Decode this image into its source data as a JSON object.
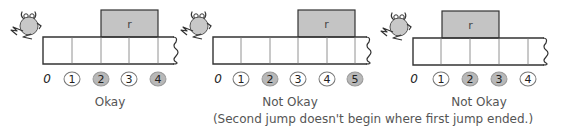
{
  "colors": {
    "box_fill": "#c4c4c4",
    "stroke": "#333333",
    "circle_shaded": "#b8b8b8",
    "frog_fill": "#c8c8c8"
  },
  "panels": [
    {
      "id": "okay",
      "x": 0,
      "strip": {
        "left": 43,
        "cells": [
          43,
          72,
          101,
          129,
          158
        ],
        "right": 170,
        "top": 37,
        "bottom": 64
      },
      "box": {
        "left": 101,
        "right": 158,
        "top": 10,
        "bottom": 37,
        "label": "r"
      },
      "zero_label": "0",
      "zero_x": 47,
      "numbers": [
        {
          "label": "1",
          "x": 72,
          "shaded": false
        },
        {
          "label": "2",
          "x": 101,
          "shaded": true
        },
        {
          "label": "3",
          "x": 129,
          "shaded": false
        },
        {
          "label": "4",
          "x": 158,
          "shaded": true
        }
      ],
      "caption": "Okay",
      "caption_x": 110,
      "note": ""
    },
    {
      "id": "not-okay-1",
      "x": 190,
      "strip": {
        "left": 213,
        "cells": [
          213,
          241,
          270,
          298,
          327,
          355
        ],
        "right": 363,
        "top": 37,
        "bottom": 64
      },
      "box": {
        "left": 298,
        "right": 355,
        "top": 10,
        "bottom": 37,
        "label": "r"
      },
      "zero_label": "0",
      "zero_x": 218,
      "numbers": [
        {
          "label": "1",
          "x": 241,
          "shaded": false
        },
        {
          "label": "2",
          "x": 270,
          "shaded": true
        },
        {
          "label": "3",
          "x": 298,
          "shaded": false
        },
        {
          "label": "4",
          "x": 327,
          "shaded": false
        },
        {
          "label": "5",
          "x": 355,
          "shaded": true
        }
      ],
      "caption": "Not Okay",
      "caption_x": 290,
      "note": "(Second jump doesn't begin where first jump ended.)"
    },
    {
      "id": "not-okay-2",
      "x": 376,
      "strip": {
        "left": 413,
        "cells": [
          413,
          441,
          470,
          499,
          528
        ],
        "right": 540,
        "top": 38,
        "bottom": 65
      },
      "box": {
        "left": 442,
        "right": 499,
        "top": 11,
        "bottom": 38,
        "label": "r"
      },
      "zero_label": "0",
      "zero_x": 414,
      "numbers": [
        {
          "label": "1",
          "x": 441,
          "shaded": false
        },
        {
          "label": "2",
          "x": 470,
          "shaded": true
        },
        {
          "label": "3",
          "x": 499,
          "shaded": true
        },
        {
          "label": "4",
          "x": 528,
          "shaded": false
        }
      ],
      "caption": "Not Okay",
      "caption_x": 479,
      "note": ""
    }
  ],
  "note_x": 373,
  "note_y": 112,
  "caption_y": 95,
  "labels_y": 79
}
